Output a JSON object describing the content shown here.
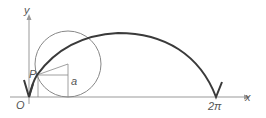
{
  "diagram": {
    "labels": {
      "y_axis": "y",
      "x_axis": "x",
      "origin": "O",
      "point": "P",
      "radius": "a",
      "end": "2π"
    },
    "colors": {
      "curve": "#3a3a3a",
      "axes": "#888888",
      "circle": "#888888",
      "text": "#555555"
    }
  }
}
